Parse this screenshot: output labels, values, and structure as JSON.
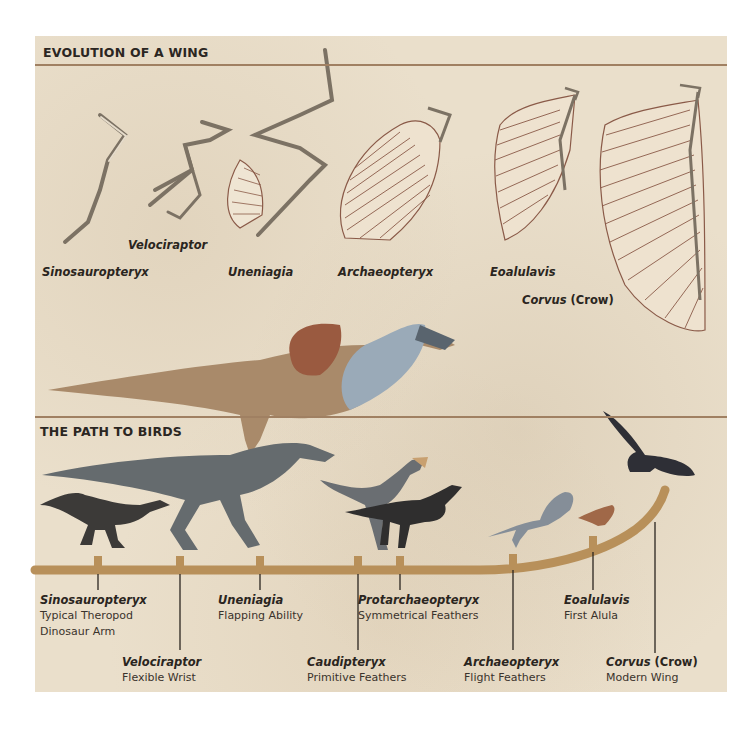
{
  "sections": {
    "top_title": "EVOLUTION OF A WING",
    "bottom_title": "THE PATH TO BIRDS"
  },
  "wing_labels": [
    {
      "name": "Sinosauropteryx"
    },
    {
      "name": "Velociraptor"
    },
    {
      "name": "Uneniagia"
    },
    {
      "name": "Archaeopteryx"
    },
    {
      "name": "Eoalulavis"
    },
    {
      "name": "Corvus",
      "suffix": "(Crow)"
    }
  ],
  "timeline_nodes": [
    {
      "name": "Sinosauropteryx",
      "desc1": "Typical Theropod",
      "desc2": "Dinosaur Arm"
    },
    {
      "name": "Velociraptor",
      "desc1": "Flexible Wrist"
    },
    {
      "name": "Uneniagia",
      "desc1": "Flapping Ability"
    },
    {
      "name": "Caudipteryx",
      "desc1": "Primitive Feathers"
    },
    {
      "name": "Protarchaeopteryx",
      "desc1": "Symmetrical Feathers"
    },
    {
      "name": "Archaeopteryx",
      "desc1": "Flight Feathers"
    },
    {
      "name": "Eoalulavis",
      "desc1": "First Alula"
    },
    {
      "name": "Corvus",
      "suffix": "(Crow)",
      "desc1": "Modern Wing"
    }
  ],
  "colors": {
    "background": "#eadfcb",
    "rule": "#a08062",
    "branch": "#b8905a",
    "text": "#2a2520",
    "bone": "#d9ccb6",
    "feather_line": "#8a5a48"
  }
}
